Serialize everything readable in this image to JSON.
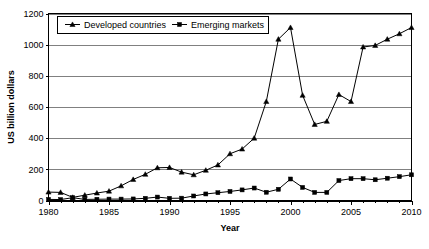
{
  "chart_data": {
    "type": "line",
    "title": "",
    "xlabel": "Year",
    "ylabel": "US billion dollars",
    "xlim": [
      1980,
      2010
    ],
    "ylim": [
      0,
      1200
    ],
    "ytick_labels": [
      "0",
      "200",
      "400",
      "600",
      "800",
      "1000",
      "1200"
    ],
    "yticks": [
      0,
      200,
      400,
      600,
      800,
      1000,
      1200
    ],
    "xtick_labels": [
      "1980",
      "1985",
      "1990",
      "1995",
      "2000",
      "2005",
      "2010"
    ],
    "xticks": [
      1980,
      1985,
      1990,
      1995,
      2000,
      2005,
      2010
    ],
    "grid": "horizontal",
    "legend_position": "top-left-inside",
    "x": [
      1980,
      1981,
      1982,
      1983,
      1984,
      1985,
      1986,
      1987,
      1988,
      1989,
      1990,
      1991,
      1992,
      1993,
      1994,
      1995,
      1996,
      1997,
      1998,
      1999,
      2000,
      2001,
      2002,
      2003,
      2004,
      2005,
      2006,
      2007,
      2008,
      2009,
      2010
    ],
    "series": [
      {
        "name": "Developed countries",
        "marker": "triangle",
        "color": "#000000",
        "values": [
          54,
          52,
          20,
          34,
          48,
          60,
          94,
          135,
          168,
          210,
          212,
          182,
          165,
          194,
          228,
          300,
          330,
          400,
          635,
          1035,
          1110,
          675,
          488,
          508,
          680,
          635,
          985,
          995,
          1035,
          1070,
          1110
        ]
      },
      {
        "name": "Emerging markets",
        "marker": "square",
        "color": "#000000",
        "values": [
          7,
          6,
          18,
          7,
          8,
          9,
          9,
          10,
          14,
          22,
          14,
          15,
          29,
          42,
          50,
          58,
          68,
          80,
          53,
          72,
          138,
          84,
          52,
          52,
          128,
          140,
          140,
          133,
          143,
          153,
          165
        ]
      }
    ]
  },
  "legend": {
    "items": [
      {
        "label": "Developed countries",
        "marker": "triangle"
      },
      {
        "label": "Emerging markets",
        "marker": "square"
      }
    ]
  }
}
